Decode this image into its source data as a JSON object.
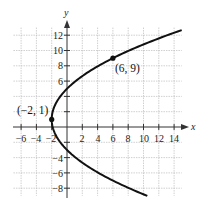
{
  "chart_data": {
    "type": "line",
    "title": "",
    "xlabel": "x",
    "ylabel": "y",
    "xlim": [
      -7,
      15
    ],
    "ylim": [
      -9,
      13
    ],
    "grid": true,
    "grid_step": 2,
    "x_ticks": [
      -6,
      -4,
      -2,
      2,
      4,
      6,
      8,
      10,
      12,
      14
    ],
    "y_ticks": [
      -8,
      -6,
      -4,
      6,
      8,
      10,
      12
    ],
    "series": [
      {
        "name": "parabola (y-1)^2 = 8(x+2)",
        "equation": "(y - 1)^2 = 8(x + 2)",
        "y_range": [
          -9,
          12.66
        ],
        "color": "#111111"
      }
    ],
    "points": [
      {
        "x": -2,
        "y": 1,
        "label": "(−2, 1)"
      },
      {
        "x": 6,
        "y": 9,
        "label": "(6, 9)"
      }
    ]
  },
  "labels": {
    "x_axis": "x",
    "y_axis": "y",
    "x_ticks": [
      "−6",
      "−4",
      "−2",
      "2",
      "4",
      "6",
      "8",
      "10",
      "12",
      "14"
    ],
    "y_ticks": [
      "12",
      "10",
      "8",
      "6",
      "−4",
      "−6",
      "−8"
    ],
    "vertex": "(−2, 1)",
    "point": "(6, 9)"
  }
}
